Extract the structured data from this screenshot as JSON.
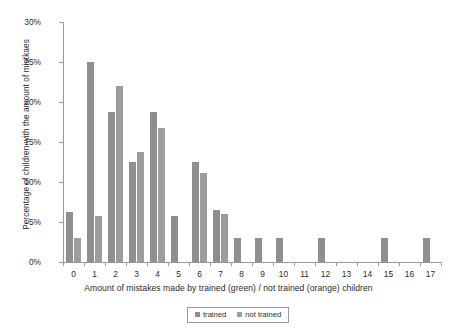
{
  "chart_data": {
    "type": "bar",
    "title": "",
    "subtitle": "",
    "xlabel": "Amount of mistakes made by trained (green) / not trained (orange) children",
    "ylabel": "Percentage of children with the amount of mistkaes",
    "categories": [
      "0",
      "1",
      "2",
      "3",
      "4",
      "5",
      "6",
      "7",
      "8",
      "9",
      "10",
      "11",
      "12",
      "13",
      "14",
      "15",
      "16",
      "17"
    ],
    "series": [
      {
        "name": "trained",
        "color": "#8f8f8f",
        "values": [
          6.3,
          25.0,
          18.8,
          12.5,
          18.8,
          5.7,
          12.5,
          6.5,
          3.0,
          3.0,
          3.0,
          0,
          3.0,
          0,
          0,
          3.0,
          0,
          3.0
        ]
      },
      {
        "name": "not trained",
        "color": "#9d9d9d",
        "values": [
          3.0,
          5.7,
          22.0,
          13.8,
          16.7,
          0,
          11.1,
          6.0,
          0,
          0,
          0,
          0,
          0,
          0,
          0,
          0,
          0,
          0
        ]
      }
    ],
    "ylim": [
      0,
      30
    ],
    "yticks": [
      0,
      5,
      10,
      15,
      20,
      25,
      30
    ],
    "ytick_labels": [
      "0%",
      "5%",
      "10%",
      "15%",
      "20%",
      "25%",
      "30%"
    ],
    "grid": false,
    "legend_position": "bottom",
    "legend_entries": [
      "trained",
      "not trained"
    ]
  }
}
